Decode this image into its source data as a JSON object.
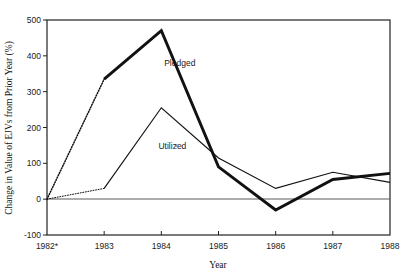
{
  "chart_data": {
    "type": "line",
    "title": "",
    "xlabel": "Year",
    "ylabel": "Change in Value of EJVs from Prior Year (%)",
    "categories": [
      "1982*",
      "1983",
      "1984",
      "1985",
      "1986",
      "1987",
      "1988"
    ],
    "x": [
      1982,
      1983,
      1984,
      1985,
      1986,
      1987,
      1988
    ],
    "series": [
      {
        "name": "Pledged",
        "values": [
          0,
          335,
          470,
          90,
          -30,
          55,
          72
        ],
        "style": "thick",
        "dashed_segment": "1982-1983"
      },
      {
        "name": "Utilized",
        "values": [
          0,
          30,
          255,
          115,
          30,
          75,
          47
        ],
        "style": "thin",
        "dashed_segment": "1982-1983"
      }
    ],
    "ylim": [
      -100,
      500
    ],
    "yticks": [
      -100,
      0,
      100,
      200,
      300,
      400,
      500
    ],
    "ytick_labels": [
      "-100",
      "0",
      "100",
      "200",
      "300",
      "400",
      "500"
    ],
    "xtick_labels": [
      "1982*",
      "1983",
      "1984",
      "1985",
      "1986",
      "1987",
      "1988"
    ],
    "grid": false,
    "legend_position": "inline-annotation",
    "zero_line": 0,
    "annotations": [
      {
        "text": "Pledged",
        "x": 1984.05,
        "y": 372
      },
      {
        "text": "Utilized",
        "x": 1983.95,
        "y": 140
      }
    ]
  },
  "axes": {
    "y_title": "Change in Value of EJVs from Prior Year (%)",
    "x_title": "Year"
  },
  "colors": {
    "line": "#111111",
    "axis": "#222222",
    "zero_line": "#555555",
    "background": "#ffffff"
  }
}
